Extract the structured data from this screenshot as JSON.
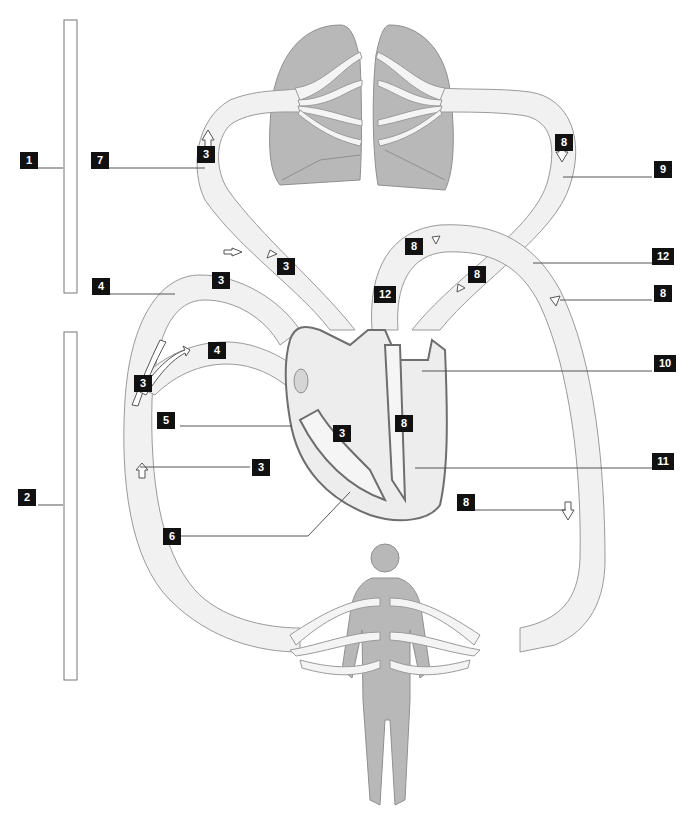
{
  "diagram": {
    "type": "circulatory-system-labeling-diagram",
    "colors": {
      "vessel_fill": "#f1f1f1",
      "vessel_stroke": "#9a9a9a",
      "organ_fill": "#b8b8b8",
      "label_bg": "#111111",
      "label_text": "#ffffff"
    },
    "brackets": [
      {
        "id": "pulmonary-circuit-bracket",
        "label": "1"
      },
      {
        "id": "systemic-circuit-bracket",
        "label": "2"
      }
    ],
    "labels": [
      {
        "id": "l1",
        "text": "1"
      },
      {
        "id": "l2",
        "text": "2"
      },
      {
        "id": "l3a",
        "text": "3"
      },
      {
        "id": "l3b",
        "text": "3"
      },
      {
        "id": "l3c",
        "text": "3"
      },
      {
        "id": "l3d",
        "text": "3"
      },
      {
        "id": "l3e",
        "text": "3"
      },
      {
        "id": "l3f",
        "text": "3"
      },
      {
        "id": "l4a",
        "text": "4"
      },
      {
        "id": "l4b",
        "text": "4"
      },
      {
        "id": "l5",
        "text": "5"
      },
      {
        "id": "l6",
        "text": "6"
      },
      {
        "id": "l7",
        "text": "7"
      },
      {
        "id": "l8a",
        "text": "8"
      },
      {
        "id": "l8b",
        "text": "8"
      },
      {
        "id": "l8c",
        "text": "8"
      },
      {
        "id": "l8d",
        "text": "8"
      },
      {
        "id": "l8e",
        "text": "8"
      },
      {
        "id": "l8f",
        "text": "8"
      },
      {
        "id": "l9",
        "text": "9"
      },
      {
        "id": "l10",
        "text": "10"
      },
      {
        "id": "l11",
        "text": "11"
      },
      {
        "id": "l12a",
        "text": "12"
      },
      {
        "id": "l12b",
        "text": "12"
      }
    ],
    "structures": [
      "lungs",
      "heart",
      "human-body",
      "pulmonary-vessels",
      "systemic-vessels"
    ]
  }
}
